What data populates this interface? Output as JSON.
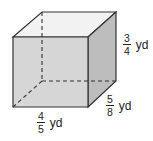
{
  "figure": {
    "type": "rectangular-prism",
    "colors": {
      "front_face": "#d6d6d6",
      "top_face": "#f2f2f2",
      "side_face": "#bdbdbd",
      "edge": "#333333"
    },
    "dimensions": {
      "height": {
        "numerator": "3",
        "denominator": "4",
        "unit": "yd"
      },
      "depth": {
        "numerator": "5",
        "denominator": "8",
        "unit": "yd"
      },
      "width": {
        "numerator": "4",
        "denominator": "5",
        "unit": "yd"
      }
    }
  }
}
